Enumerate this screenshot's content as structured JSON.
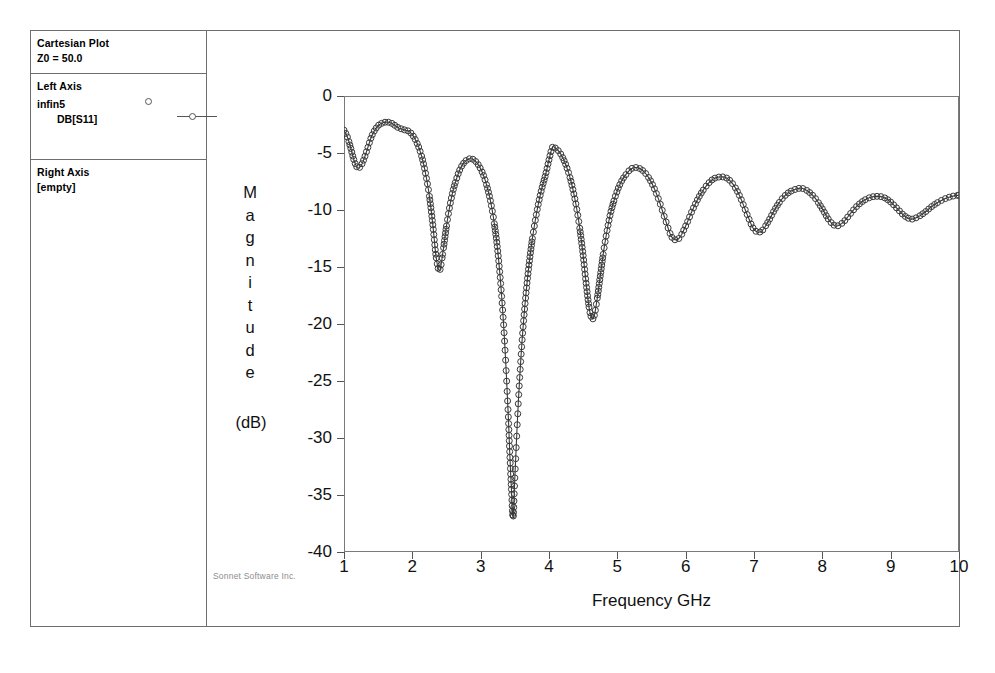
{
  "window": {
    "legend": {
      "title": "Cartesian Plot",
      "impedance": "Z0 = 50.0",
      "left_axis_header": "Left Axis",
      "project_name": "infin5",
      "trace_label": "DB[S11]",
      "right_axis_header": "Right Axis",
      "right_axis_value": "[empty]",
      "project_marker_icon": "open-circle-marker",
      "trace_marker_icon": "line-with-open-circle-marker"
    },
    "watermark": "Sonnet Software Inc."
  },
  "chart_data": {
    "type": "line",
    "title": "",
    "xlabel": "Frequency GHz",
    "ylabel": "Magnitude",
    "yunit": "(dB)",
    "ylabel_chars": [
      "M",
      "a",
      "g",
      "n",
      "i",
      "t",
      "u",
      "d",
      "e"
    ],
    "xlim": [
      1,
      10
    ],
    "ylim": [
      -40,
      0
    ],
    "xticks": [
      1,
      2,
      3,
      4,
      5,
      6,
      7,
      8,
      9,
      10
    ],
    "yticks": [
      0,
      -5,
      -10,
      -15,
      -20,
      -25,
      -30,
      -35,
      -40
    ],
    "xtick_labels": [
      "1",
      "2",
      "3",
      "4",
      "5",
      "6",
      "7",
      "8",
      "9",
      "10"
    ],
    "ytick_labels": [
      "0",
      "-5",
      "-10",
      "-15",
      "-20",
      "-25",
      "-30",
      "-35",
      "-40"
    ],
    "grid": false,
    "legend_position": "left-panel",
    "marker": "open-circle",
    "marker_size": 3,
    "line_color": "#3a3a3a",
    "series": [
      {
        "name": "DB[S11]",
        "x": [
          1.0,
          1.05,
          1.1,
          1.15,
          1.2,
          1.25,
          1.3,
          1.35,
          1.4,
          1.45,
          1.5,
          1.55,
          1.6,
          1.65,
          1.7,
          1.75,
          1.8,
          1.85,
          1.9,
          1.95,
          2.0,
          2.05,
          2.1,
          2.15,
          2.2,
          2.25,
          2.3,
          2.35,
          2.4,
          2.45,
          2.5,
          2.55,
          2.6,
          2.65,
          2.7,
          2.75,
          2.8,
          2.85,
          2.9,
          2.95,
          3.0,
          3.05,
          3.1,
          3.15,
          3.2,
          3.25,
          3.3,
          3.35,
          3.4,
          3.425,
          3.45,
          3.475,
          3.5,
          3.55,
          3.6,
          3.65,
          3.7,
          3.75,
          3.8,
          3.85,
          3.9,
          3.95,
          4.0,
          4.05,
          4.1,
          4.15,
          4.2,
          4.25,
          4.3,
          4.35,
          4.4,
          4.45,
          4.5,
          4.55,
          4.6,
          4.65,
          4.7,
          4.75,
          4.8,
          4.85,
          4.9,
          4.95,
          5.0,
          5.05,
          5.1,
          5.2,
          5.3,
          5.4,
          5.5,
          5.6,
          5.7,
          5.8,
          5.9,
          6.0,
          6.1,
          6.2,
          6.3,
          6.4,
          6.5,
          6.6,
          6.7,
          6.8,
          6.9,
          7.0,
          7.1,
          7.2,
          7.3,
          7.4,
          7.5,
          7.6,
          7.7,
          7.8,
          7.9,
          8.0,
          8.1,
          8.2,
          8.3,
          8.4,
          8.5,
          8.6,
          8.7,
          8.8,
          8.9,
          9.0,
          9.1,
          9.2,
          9.3,
          9.4,
          9.5,
          9.6,
          9.7,
          9.8,
          9.9,
          10.0
        ],
        "y": [
          -3.0,
          -3.6,
          -4.6,
          -5.7,
          -6.3,
          -6.1,
          -5.4,
          -4.5,
          -3.6,
          -3.0,
          -2.6,
          -2.4,
          -2.3,
          -2.3,
          -2.4,
          -2.6,
          -2.8,
          -2.9,
          -3.0,
          -3.1,
          -3.4,
          -3.9,
          -4.6,
          -5.6,
          -7.0,
          -8.8,
          -11.3,
          -14.2,
          -15.3,
          -13.6,
          -11.4,
          -9.6,
          -8.2,
          -7.2,
          -6.4,
          -5.9,
          -5.6,
          -5.5,
          -5.6,
          -5.9,
          -6.4,
          -7.1,
          -8.1,
          -9.4,
          -11.2,
          -13.6,
          -17.0,
          -21.5,
          -27.5,
          -31.2,
          -34.5,
          -37.0,
          -33.5,
          -27.0,
          -22.0,
          -18.2,
          -15.2,
          -12.8,
          -10.9,
          -9.3,
          -8.0,
          -6.9,
          -5.6,
          -4.5,
          -4.6,
          -4.9,
          -5.4,
          -6.1,
          -7.0,
          -8.2,
          -9.7,
          -11.6,
          -14.0,
          -16.8,
          -19.0,
          -19.5,
          -18.0,
          -15.8,
          -13.6,
          -11.8,
          -10.3,
          -9.2,
          -8.3,
          -7.6,
          -7.1,
          -6.4,
          -6.3,
          -6.7,
          -7.6,
          -9.0,
          -10.8,
          -12.4,
          -12.5,
          -11.4,
          -10.0,
          -8.8,
          -7.9,
          -7.3,
          -7.1,
          -7.2,
          -7.8,
          -8.9,
          -10.4,
          -11.7,
          -11.9,
          -11.1,
          -10.0,
          -9.1,
          -8.5,
          -8.2,
          -8.1,
          -8.4,
          -9.0,
          -9.9,
          -10.9,
          -11.4,
          -11.1,
          -10.4,
          -9.7,
          -9.2,
          -8.9,
          -8.8,
          -8.9,
          -9.3,
          -9.9,
          -10.5,
          -10.8,
          -10.6,
          -10.2,
          -9.7,
          -9.3,
          -9.0,
          -8.8,
          -8.7
        ]
      }
    ]
  }
}
